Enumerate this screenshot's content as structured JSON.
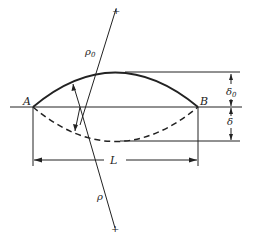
{
  "diagram": {
    "labels": {
      "point_a": "A",
      "point_b": "B",
      "length": "L",
      "rho0": "ρ",
      "rho0_sub": "0",
      "rho": "ρ",
      "delta0": "δ",
      "delta0_sub": "0",
      "delta": "δ",
      "center_mark_top": "+",
      "center_mark_bottom": "+"
    },
    "colors": {
      "stroke": "#222222",
      "background": "#ffffff"
    }
  }
}
